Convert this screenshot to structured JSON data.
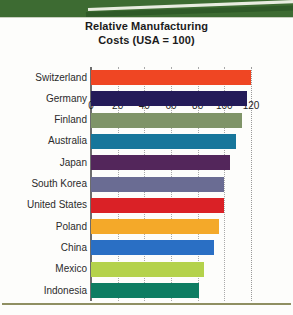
{
  "chart_data": {
    "type": "bar",
    "orientation": "horizontal",
    "title": "Relative Manufacturing Costs (USA = 100)",
    "title_line1": "Relative Manufacturing",
    "title_line2": "Costs (USA = 100)",
    "xlabel": "",
    "ylabel": "",
    "xlim": [
      0,
      120
    ],
    "xticks": [
      0,
      20,
      40,
      60,
      80,
      100,
      120
    ],
    "xtick_labels": [
      "0",
      "20",
      "40",
      "60",
      "80",
      "100",
      "120"
    ],
    "grid": true,
    "grid_style": "dotted vertical",
    "legend": "none",
    "categories": [
      "Switzerland",
      "Germany",
      "Finland",
      "Australia",
      "Japan",
      "South Korea",
      "United States",
      "Poland",
      "China",
      "Mexico",
      "Indonesia"
    ],
    "values": [
      120,
      117,
      113,
      109,
      104,
      100,
      100,
      96,
      92,
      85,
      81
    ],
    "colors": [
      "#ef4623",
      "#241b58",
      "#7f9468",
      "#17769b",
      "#53265b",
      "#6a6c93",
      "#da2126",
      "#f4a929",
      "#2a6fc4",
      "#b4d24b",
      "#0e7d62"
    ],
    "bars": [
      {
        "label": "Switzerland",
        "value": 120,
        "color": "#ef4623"
      },
      {
        "label": "Germany",
        "value": 117,
        "color": "#241b58"
      },
      {
        "label": "Finland",
        "value": 113,
        "color": "#7f9468"
      },
      {
        "label": "Australia",
        "value": 109,
        "color": "#17769b"
      },
      {
        "label": "Japan",
        "value": 104,
        "color": "#53265b"
      },
      {
        "label": "South Korea",
        "value": 100,
        "color": "#6a6c93"
      },
      {
        "label": "United States",
        "value": 100,
        "color": "#da2126"
      },
      {
        "label": "Poland",
        "value": 96,
        "color": "#f4a929"
      },
      {
        "label": "China",
        "value": 92,
        "color": "#2a6fc4"
      },
      {
        "label": "Mexico",
        "value": 85,
        "color": "#b4d24b"
      },
      {
        "label": "Indonesia",
        "value": 81,
        "color": "#0e7d62"
      }
    ]
  },
  "decor": {
    "band_color": "#3d6b32",
    "rule_color": "#8f8f62"
  }
}
